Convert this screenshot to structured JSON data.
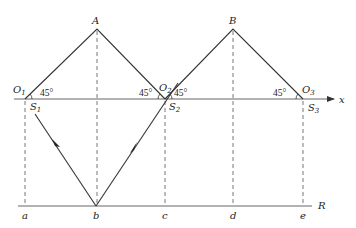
{
  "diagram": {
    "title": "",
    "axis_label": "x",
    "ground_label": "R",
    "points": {
      "A": "A",
      "B": "B",
      "O1": {
        "base": "O",
        "sub": "1"
      },
      "O2": {
        "base": "O",
        "sub": "2"
      },
      "O3": {
        "base": "O",
        "sub": "3"
      },
      "S1": {
        "base": "S",
        "sub": "1"
      },
      "S2": {
        "base": "S",
        "sub": "2"
      },
      "S3": {
        "base": "S",
        "sub": "3"
      }
    },
    "ground_points": [
      "a",
      "b",
      "c",
      "d",
      "e"
    ],
    "angles": {
      "O1_right": "45°",
      "O2_left": "45°",
      "O2_right": "45°",
      "O3_left": "45°"
    },
    "colors": {
      "line": "#333333",
      "axis": "#555555",
      "background": "#ffffff"
    }
  }
}
